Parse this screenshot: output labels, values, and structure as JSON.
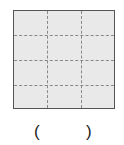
{
  "figure": {
    "shape": "square",
    "rows": 4,
    "cols": 3,
    "fill_color": "#e9e9e9",
    "border_color": "#555555",
    "dashed_line_color": "#888888"
  },
  "answer_blank": {
    "open": "(",
    "close": ")",
    "value": ""
  }
}
